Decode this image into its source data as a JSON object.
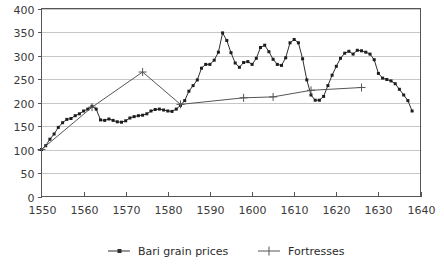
{
  "chart_data": {
    "type": "line",
    "title": "",
    "subtitle": "",
    "xlabel": "",
    "ylabel": "",
    "xlim": [
      1550,
      1640
    ],
    "ylim": [
      0,
      400
    ],
    "x_ticks": [
      1550,
      1560,
      1570,
      1580,
      1590,
      1600,
      1610,
      1620,
      1630,
      1640
    ],
    "y_ticks": [
      0,
      50,
      100,
      150,
      200,
      250,
      300,
      350,
      400
    ],
    "x_tick_labels": [
      "1550",
      "1560",
      "1570",
      "1580",
      "1590",
      "1600",
      "1610",
      "1620",
      "1630",
      "1640"
    ],
    "y_tick_labels": [
      "0",
      "50",
      "100",
      "150",
      "200",
      "250",
      "300",
      "350",
      "400"
    ],
    "grid": "horizontal",
    "legend_position": "bottom",
    "series": [
      {
        "name": "Bari grain prices",
        "marker": "square",
        "color": "#2e2e2e",
        "points": [
          [
            1550,
            100
          ],
          [
            1551,
            108
          ],
          [
            1552,
            122
          ],
          [
            1553,
            133
          ],
          [
            1554,
            147
          ],
          [
            1555,
            157
          ],
          [
            1556,
            164
          ],
          [
            1557,
            166
          ],
          [
            1558,
            172
          ],
          [
            1559,
            176
          ],
          [
            1560,
            182
          ],
          [
            1561,
            186
          ],
          [
            1562,
            192
          ],
          [
            1563,
            186
          ],
          [
            1564,
            163
          ],
          [
            1565,
            162
          ],
          [
            1566,
            165
          ],
          [
            1567,
            162
          ],
          [
            1568,
            159
          ],
          [
            1569,
            158
          ],
          [
            1570,
            161
          ],
          [
            1571,
            167
          ],
          [
            1572,
            170
          ],
          [
            1573,
            172
          ],
          [
            1574,
            173
          ],
          [
            1575,
            176
          ],
          [
            1576,
            182
          ],
          [
            1577,
            185
          ],
          [
            1578,
            186
          ],
          [
            1579,
            184
          ],
          [
            1580,
            182
          ],
          [
            1581,
            181
          ],
          [
            1582,
            186
          ],
          [
            1583,
            194
          ],
          [
            1584,
            204
          ],
          [
            1585,
            224
          ],
          [
            1586,
            236
          ],
          [
            1587,
            248
          ],
          [
            1588,
            273
          ],
          [
            1589,
            281
          ],
          [
            1590,
            281
          ],
          [
            1591,
            290
          ],
          [
            1592,
            307
          ],
          [
            1593,
            348
          ],
          [
            1594,
            332
          ],
          [
            1595,
            306
          ],
          [
            1596,
            284
          ],
          [
            1597,
            275
          ],
          [
            1598,
            285
          ],
          [
            1599,
            287
          ],
          [
            1600,
            281
          ],
          [
            1601,
            294
          ],
          [
            1602,
            317
          ],
          [
            1603,
            322
          ],
          [
            1604,
            308
          ],
          [
            1605,
            292
          ],
          [
            1606,
            281
          ],
          [
            1607,
            279
          ],
          [
            1608,
            295
          ],
          [
            1609,
            327
          ],
          [
            1610,
            334
          ],
          [
            1611,
            327
          ],
          [
            1612,
            293
          ],
          [
            1613,
            248
          ],
          [
            1614,
            216
          ],
          [
            1615,
            205
          ],
          [
            1616,
            205
          ],
          [
            1617,
            213
          ],
          [
            1618,
            236
          ],
          [
            1619,
            258
          ],
          [
            1620,
            277
          ],
          [
            1621,
            294
          ],
          [
            1622,
            305
          ],
          [
            1623,
            309
          ],
          [
            1624,
            303
          ],
          [
            1625,
            311
          ],
          [
            1626,
            310
          ],
          [
            1627,
            307
          ],
          [
            1628,
            303
          ],
          [
            1629,
            291
          ],
          [
            1630,
            262
          ],
          [
            1631,
            252
          ],
          [
            1632,
            249
          ],
          [
            1633,
            246
          ],
          [
            1634,
            240
          ],
          [
            1635,
            228
          ],
          [
            1636,
            216
          ],
          [
            1637,
            204
          ],
          [
            1638,
            182
          ]
        ]
      },
      {
        "name": "Fortresses",
        "marker": "plus",
        "color": "#555555",
        "points": [
          [
            1550,
            100
          ],
          [
            1562,
            190
          ],
          [
            1574,
            265
          ],
          [
            1583,
            196
          ],
          [
            1598,
            210
          ],
          [
            1605,
            212
          ],
          [
            1614,
            226
          ],
          [
            1626,
            232
          ]
        ]
      }
    ],
    "legend": [
      {
        "label": "Bari grain prices",
        "marker": "square",
        "color": "#2e2e2e"
      },
      {
        "label": "Fortresses",
        "marker": "plus",
        "color": "#555555"
      }
    ]
  },
  "colors": {
    "background": "#ffffff",
    "axis": "#555555",
    "grid": "#b9b9b9",
    "bari": "#2e2e2e",
    "fortresses": "#555555",
    "text": "#3a3a3a"
  }
}
